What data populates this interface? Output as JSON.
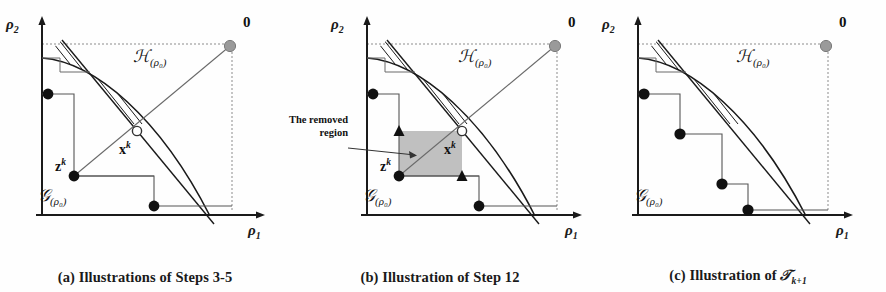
{
  "figure": {
    "kind": "three-panel mathematical illustration",
    "panels": [
      {
        "id": "a",
        "caption": "(a) Illustrations of Steps 3-5",
        "caption_prefix": "(a) Illustrations of Steps 3-5",
        "axes": {
          "x_label": "ρ",
          "x_sub": "1",
          "y_label": "ρ",
          "y_sub": "2"
        },
        "labels": {
          "hatched_region": "ℋ",
          "hatched_region_sub": "(ρ₀)",
          "staircase_region": "𝒢",
          "staircase_region_sub": "(ρ₀)",
          "origin_point": "0",
          "point_z": "z",
          "point_z_sup": "k",
          "point_x": "x",
          "point_x_sup": "k"
        },
        "markers": {
          "black_dots": 3,
          "grey_dots": 1,
          "open_circles": 1,
          "triangles": 0
        }
      },
      {
        "id": "b",
        "caption": "(b) Illustration of Step 12",
        "caption_prefix": "(b) Illustration of Step 12",
        "axes": {
          "x_label": "ρ",
          "x_sub": "1",
          "y_label": "ρ",
          "y_sub": "2"
        },
        "labels": {
          "hatched_region": "ℋ",
          "hatched_region_sub": "(ρ₀)",
          "staircase_region": "𝒢",
          "staircase_region_sub": "(ρ₀)",
          "origin_point": "0",
          "point_z": "z",
          "point_z_sup": "k",
          "point_x": "x",
          "point_x_sup": "k",
          "annotation_line1": "The removed",
          "annotation_line2": "region"
        },
        "markers": {
          "black_dots": 3,
          "grey_dots": 1,
          "open_circles": 1,
          "triangles": 2
        }
      },
      {
        "id": "c",
        "caption_prefix": "(c) Illustration of ",
        "caption_symbol": "𝒯",
        "caption_sub": "k+1",
        "caption": "(c) Illustration of T k+1",
        "axes": {
          "x_label": "ρ",
          "x_sub": "1",
          "y_label": "ρ",
          "y_sub": "2"
        },
        "labels": {
          "hatched_region": "ℋ",
          "hatched_region_sub": "(ρ₀)",
          "staircase_region": "𝒢",
          "staircase_region_sub": "(ρ₀)",
          "origin_point": "0"
        },
        "markers": {
          "black_dots": 4,
          "grey_dots": 1,
          "open_circles": 0,
          "triangles": 0
        }
      }
    ],
    "colors": {
      "ink": "#1a1a1a",
      "grey_dot": "#9a9a9a",
      "removed_region_fill": "#c0c0c0",
      "thin_line": "#555555",
      "background": "#ffffff"
    }
  }
}
